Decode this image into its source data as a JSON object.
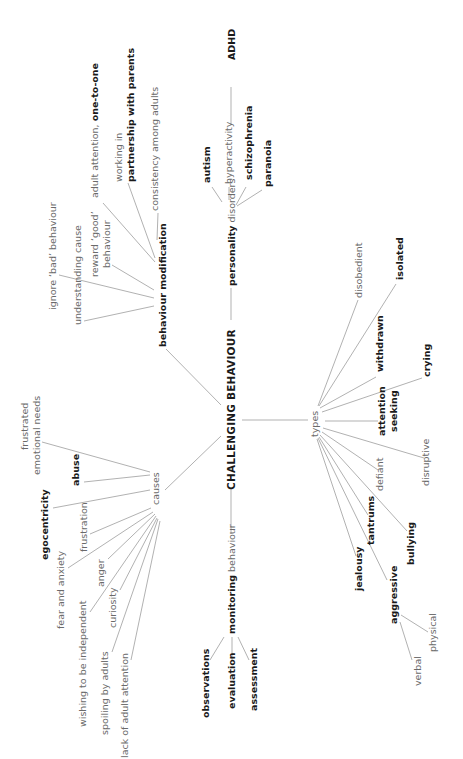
{
  "diagram": {
    "type": "mind-map",
    "orientation": "rotated 90 degrees counter-clockwise",
    "colors": {
      "line": "#a8a8a8",
      "bold_text": "#1a1a1a",
      "regular_text": "#6a6a6a",
      "background": "#ffffff"
    },
    "central": {
      "label": "CHALLENGING BEHAVIOUR"
    },
    "branches": {
      "personality": {
        "label_bold": "personality",
        "label_regular": " disorders",
        "children": {
          "autism": "autism",
          "hyperactivity": "hyperactivity",
          "adhd": "ADHD",
          "schizophrenia": "schizophrenia",
          "paranoia": "paranoia"
        }
      },
      "modification": {
        "label": "behaviour modification",
        "children": {
          "understanding": "understanding cause",
          "ignore": "ignore ‘bad’ behaviour",
          "reward_1": "reward ‘good’",
          "reward_2": "behaviour",
          "adult_attention_regular": "adult attention, ",
          "adult_attention_bold": "one-to-one",
          "working_1": "working in",
          "working_2": "partnership with parents",
          "consistency": "consistency among adults"
        }
      },
      "causes": {
        "label": "causes",
        "children": {
          "frustrated_1": "frustrated",
          "frustrated_2": "emotional needs",
          "abuse": "abuse",
          "egocentricity": "egocentricity",
          "frustration": "frustration",
          "fear": "fear and anxiety",
          "anger": "anger",
          "wishing": "wishing to be independent",
          "curiosity": "curiosity",
          "spoiling": "spoiling by adults",
          "lack": "lack of adult attention"
        }
      },
      "monitoring": {
        "label_bold": "monitoring",
        "label_regular": " behaviour",
        "children": {
          "observations": "observations",
          "evaluation": "evaluation",
          "assessment": "assessment"
        }
      },
      "types": {
        "label": "types",
        "children": {
          "disobedient": "disobedient",
          "isolated": "isolated",
          "withdrawn": "withdrawn",
          "crying": "crying",
          "attention_1": "attention",
          "attention_2": "seeking",
          "disruptive": "disruptive",
          "defiant": "defiant",
          "bullying": "bullying",
          "tantrums": "tantrums",
          "jealousy": "jealousy",
          "aggressive": "aggressive",
          "physical": "physical",
          "verbal": "verbal"
        }
      }
    }
  }
}
